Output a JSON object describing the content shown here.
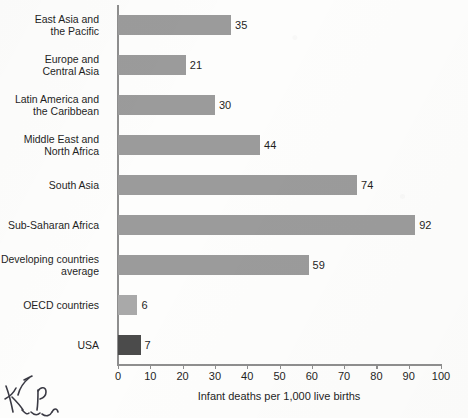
{
  "chart_data": {
    "type": "bar",
    "orientation": "horizontal",
    "title": "",
    "xlabel": "Infant deaths per 1,000 live births",
    "ylabel": "",
    "xlim": [
      0,
      100
    ],
    "xticks": [
      0,
      10,
      20,
      30,
      40,
      50,
      60,
      70,
      80,
      90,
      100
    ],
    "grid": false,
    "legend": null,
    "categories": [
      "East Asia and\nthe Pacific",
      "Europe and\nCentral Asia",
      "Latin America and\nthe Caribbean",
      "Middle East and\nNorth Africa",
      "South Asia",
      "Sub-Saharan Africa",
      "Developing countries\naverage",
      "OECD countries",
      "USA"
    ],
    "values": [
      35,
      21,
      30,
      44,
      74,
      92,
      59,
      6,
      7
    ],
    "value_labels": [
      "35",
      "21",
      "30",
      "44",
      "74",
      "92",
      "59",
      "6",
      "7"
    ],
    "bar_styles": [
      "normal",
      "normal",
      "normal",
      "normal",
      "normal",
      "normal",
      "normal",
      "light",
      "dark"
    ],
    "colors": {
      "bar": "#9b9b9b",
      "bar_light": "#a9a9a9",
      "bar_highlight": "#4b4b4b",
      "axis": "#8e8e8e",
      "text": "#1f1f1f",
      "background": "#fdfdfc",
      "ink": "#3a3a44"
    }
  },
  "annotations": {
    "handwriting": "handwritten pen scribble"
  }
}
